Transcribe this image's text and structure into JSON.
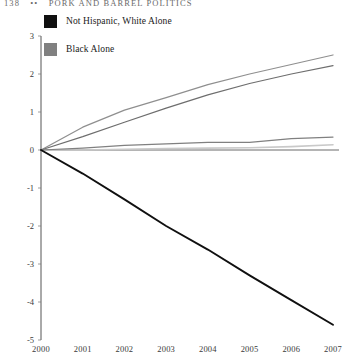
{
  "running_head": {
    "folio": "138",
    "separator": "••",
    "title": "Pork and Barrel Politics"
  },
  "legend": {
    "position": "top-left",
    "items": [
      {
        "label": "Not Hispanic, White Alone",
        "color": "#101010"
      },
      {
        "label": "Black Alone",
        "color": "#808080"
      }
    ]
  },
  "axes": {
    "y_ticks": [
      "3",
      "2",
      "1",
      "0",
      "-1",
      "-2",
      "-3",
      "-4",
      "-5"
    ],
    "x_ticks": [
      "2000",
      "2001",
      "2002",
      "2003",
      "2004",
      "2005",
      "2006",
      "2007"
    ]
  },
  "chart_data": {
    "type": "line",
    "title": "",
    "subtitle": "",
    "xlabel": "",
    "ylabel": "",
    "x": [
      2000,
      2001,
      2002,
      2003,
      2004,
      2005,
      2006,
      2007
    ],
    "xlim": [
      2000,
      2007
    ],
    "ylim": [
      -5,
      3
    ],
    "grid": false,
    "legend_position": "top-left",
    "annotations": [],
    "series": [
      {
        "name": "Not Hispanic, White Alone",
        "color": "#101010",
        "in_legend": true,
        "values": [
          0,
          -0.62,
          -1.3,
          -2.0,
          -2.62,
          -3.3,
          -3.95,
          -4.6
        ]
      },
      {
        "name": "Black Alone",
        "color": "#808080",
        "in_legend": true,
        "values": [
          0,
          0.05,
          0.12,
          0.16,
          0.2,
          0.2,
          0.3,
          0.34
        ]
      },
      {
        "name": "rising-upper",
        "color": "#8f8f8f",
        "in_legend": false,
        "values": [
          0,
          0.6,
          1.05,
          1.38,
          1.72,
          2.0,
          2.25,
          2.5
        ]
      },
      {
        "name": "rising-lower",
        "color": "#6e6e6e",
        "in_legend": false,
        "values": [
          0,
          0.35,
          0.73,
          1.1,
          1.45,
          1.75,
          2.0,
          2.22
        ]
      },
      {
        "name": "flat-light",
        "color": "#c9c9c9",
        "in_legend": false,
        "values": [
          0,
          0.0,
          0.02,
          0.04,
          0.05,
          0.06,
          0.09,
          0.14
        ]
      }
    ]
  }
}
